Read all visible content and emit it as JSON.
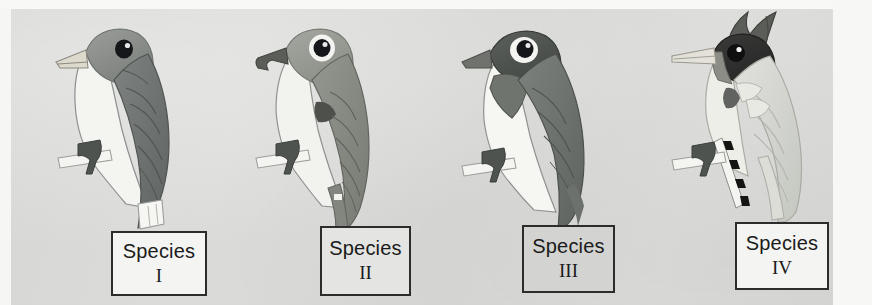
{
  "figure": {
    "kind": "textbook-figure",
    "background_color": "#dcdddA",
    "page_margin_color": "#f7f7f6"
  },
  "labels": [
    {
      "word": "Species",
      "numeral": "I",
      "box_fill": "#f4f4f2",
      "border_color": "#2c2c2c"
    },
    {
      "word": "Species",
      "numeral": "II",
      "box_fill": "#e4e5e2",
      "border_color": "#2c2c2c"
    },
    {
      "word": "Species",
      "numeral": "III",
      "box_fill": "#d3d4d1",
      "border_color": "#2c2c2c"
    },
    {
      "word": "Species",
      "numeral": "IV",
      "box_fill": "#f4f4f2",
      "border_color": "#2c2c2c"
    }
  ],
  "birds": [
    {
      "id": "species-i",
      "label": "Species I",
      "beak": "short stout conical pale beak",
      "crest": "none",
      "head_color": "#8c8f8c",
      "body_color": "#6f7370",
      "breast_color": "#f2f2ef",
      "tail": "dark tail with white tip",
      "perch": "white branch with dark foot"
    },
    {
      "id": "species-ii",
      "label": "Species II",
      "beak": "short dark hooked beak",
      "crest": "none",
      "head_color": "#94978f",
      "body_color": "#8a8d86",
      "breast_color": "#f1f1ee",
      "tail": "long grey forked tail",
      "perch": "white branch with dark foot"
    },
    {
      "id": "species-iii",
      "label": "Species III",
      "beak": "medium pointed grey beak",
      "crest": "none",
      "head_color": "#4f5350",
      "body_color": "#6c706d",
      "breast_color": "#f5f5f2",
      "tail": "long dark grey tail",
      "perch": "white branch with dark foot"
    },
    {
      "id": "species-iv",
      "label": "Species IV",
      "beak": "long thin pointed pale beak",
      "crest": "tall pointed dark crest",
      "head_color": "#2e2f2e",
      "body_color": "#d8d9d4",
      "breast_color": "#efefe9",
      "tail": "long pale tail with black and white barred streamer",
      "perch": "white branch with dark foot"
    }
  ]
}
